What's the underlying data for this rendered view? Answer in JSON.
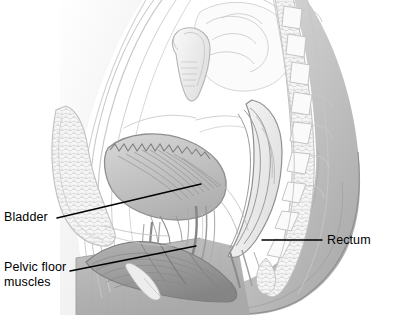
{
  "figure": {
    "width": 397,
    "height": 315,
    "background_color": "#ffffff",
    "style": "grayscale medical line illustration with stipple and hatch shading"
  },
  "labels": [
    {
      "id": "bladder",
      "text": "Bladder",
      "lines": [
        "Bladder"
      ],
      "text_color": "#000000",
      "text_x": 4,
      "text_y": 210,
      "leader": {
        "x1": 57,
        "y1": 218,
        "x2": 201,
        "y2": 184,
        "color": "#000000",
        "width": 1.4
      }
    },
    {
      "id": "pelvic-floor-muscles",
      "text": "Pelvic floor muscles",
      "lines": [
        "Pelvic floor",
        "muscles"
      ],
      "text_color": "#000000",
      "text_x": 4,
      "text_y": 260,
      "leader": {
        "x1": 70,
        "y1": 271,
        "x2": 196,
        "y2": 246,
        "color": "#000000",
        "width": 1.4
      }
    },
    {
      "id": "rectum",
      "text": "Rectum",
      "lines": [
        "Rectum"
      ],
      "text_color": "#000000",
      "text_x": 327,
      "text_y": 233,
      "leader": {
        "x1": 262,
        "y1": 240,
        "x2": 322,
        "y2": 240,
        "color": "#000000",
        "width": 1.4
      }
    }
  ],
  "palette": {
    "ink": "#6e6e6e",
    "ink_dark": "#4a4a4a",
    "ink_light": "#9a9a9a",
    "hatch": "#8a8a8a",
    "fill_pale": "#f2f2f2",
    "fill_light": "#e2e2e2",
    "fill_mid": "#c9c9c9",
    "fill_muscle": "#a8a8a8",
    "fill_muscle_dark": "#8d8d8d",
    "buttock_light": "#d6d6d6",
    "buttock_mid": "#bdbdbd",
    "buttock_dark": "#a5a5a5",
    "panel_gray": "#b4b4b4",
    "white": "#ffffff"
  },
  "structures": [
    {
      "name": "abdominal-wall",
      "region": "upper-left",
      "shade": "pale"
    },
    {
      "name": "small-intestine-loops",
      "region": "upper-center",
      "shade": "light"
    },
    {
      "name": "uterus",
      "region": "center-upper",
      "shade": "light"
    },
    {
      "name": "bladder",
      "region": "center",
      "shade": "mid"
    },
    {
      "name": "pubic-bone",
      "region": "left-lower",
      "shade": "light"
    },
    {
      "name": "urethra",
      "region": "center-lower",
      "shade": "mid"
    },
    {
      "name": "vagina",
      "region": "center-lower",
      "shade": "mid"
    },
    {
      "name": "rectum",
      "region": "right-center",
      "shade": "mid"
    },
    {
      "name": "anal-canal",
      "region": "lower-right",
      "shade": "mid"
    },
    {
      "name": "sacrum-vertebrae",
      "region": "right",
      "shade": "light"
    },
    {
      "name": "coccyx",
      "region": "right-lower",
      "shade": "light"
    },
    {
      "name": "pelvic-floor-muscles",
      "region": "bottom-center",
      "shade": "muscle"
    },
    {
      "name": "buttock-contour",
      "region": "bottom-right",
      "shade": "buttock"
    },
    {
      "name": "thigh-panel",
      "region": "bottom-left",
      "shade": "panel"
    }
  ]
}
